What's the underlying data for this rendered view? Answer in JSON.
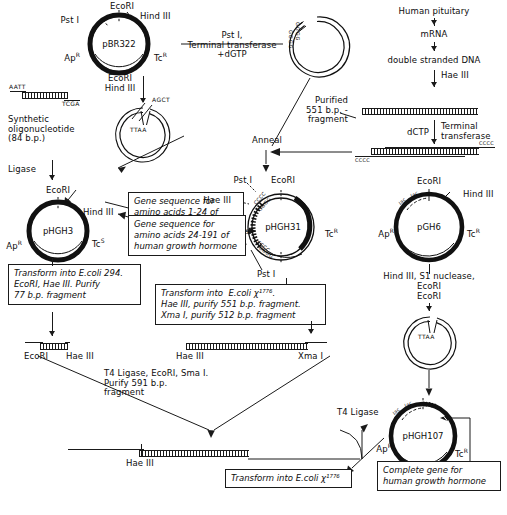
{
  "diagram": {
    "type": "molecular-cloning-flowchart"
  },
  "plasmids": {
    "pbr322": {
      "name": "pBR322",
      "markers": [
        "Pst I",
        "EcoRI",
        "Hind III",
        "Ap",
        "Tc"
      ],
      "pst": "Pst I",
      "ecori": "EcoRI",
      "hindiii": "Hind III",
      "ap": "Ap",
      "ap_sup": "R",
      "tc": "Tc",
      "tc_sup": "R"
    },
    "tailed": {
      "name": "",
      "tail": "GGGG"
    },
    "linear_hind": {
      "tail": "AGCT",
      "inner": "TTAA"
    },
    "phgh3": {
      "name": "pHGH3",
      "ecori": "EcoRI",
      "hindiii": "Hind III",
      "ap": "Ap",
      "ap_sup": "R",
      "tc": "Tc",
      "tc_sup": "S"
    },
    "phgh31": {
      "name": "pHGH31",
      "pst": "Pst I",
      "ecori": "EcoRI",
      "haeiii_top": "Hae III",
      "haeiii_bottom": "Hae III",
      "pst_bottom": "Pst I",
      "ap": "Ap",
      "ap_sup": "S",
      "tc": "Tc",
      "tc_sup": "R",
      "tails": [
        "CCCC",
        "GGGG",
        "CCCC",
        "GGGG"
      ]
    },
    "pgh6": {
      "name": "pGH6",
      "ecori": "EcoRI",
      "hindiii": "Hind III",
      "promoter": "lac",
      "promoter2": "lac",
      "ap": "Ap",
      "ap_sup": "R",
      "tc": "Tc",
      "tc_sup": "R"
    },
    "pgh6_cut": {
      "inner": "TTAA"
    },
    "phgh107": {
      "name": "pHGH107",
      "promoter": "lac",
      "promoter2": "lac",
      "ap": "Ap",
      "ap_sup": "R",
      "tc": "Tc",
      "tc_sup": "R"
    }
  },
  "reactions": {
    "pst_terminal_transferase": "Pst I,\nTerminal transferase\n+dGTP",
    "ecori_hindiii": "EcoRI\nHind III",
    "ligase": "Ligase",
    "anneal": "Anneal",
    "haeiii": "Hae III",
    "dctp": "dCTP",
    "terminal_transferase": "Terminal\ntransferase",
    "hindiii_s1_ecori": "Hind III, S1 nuclease,\nEcoRI",
    "ecori_step": "EcoRI",
    "t4_ligase": "T4 Ligase"
  },
  "pathway_right": {
    "source": "Human pituitary",
    "mrna": "mRNA",
    "ds_dna": "double stranded DNA",
    "purified_fragment": "Purified\n551 b.p. -\nfragment"
  },
  "oligo": {
    "caption": "Synthetic\noligonucleotide\n(84 b.p.)",
    "left_seq": "AATT",
    "right_seq": "TCGA"
  },
  "annotations": {
    "gene_1_24": "Gene sequence for\namino acids 1-24 of\nhuman growth hormone",
    "gene_24_191": "Gene sequence for\namino acids 24-191 of\nhuman growth hormone",
    "complete_gene": "Complete gene for\nhuman growth hormone"
  },
  "protocol_boxes": {
    "transform_294": "Transform into E.coli 294.\nEcoRI, Hae III. Purify\n77 b.p. fragment",
    "transform_x1776": "Transform into  E.coli χ¹⁷⁷⁶.\nHae III, purify 551 b.p. fragment.\nXma I, purify 512 b.p. fragment",
    "t4_ligase_ecori_smai": "T4 Ligase, EcoRI, Sma I.\nPurify 591 b.p.\nfragment",
    "transform_final": "Transform into E.coli χ¹⁷⁷⁶"
  },
  "fragments": {
    "frag_77_left": "EcoRI",
    "frag_77_right": "Hae III",
    "frag_512_left": "Hae III",
    "frag_512_right": "Xma I",
    "frag_591_label": "Hae III",
    "tails_cccc_left": "CCCC",
    "tails_cccc_right": "CCCC"
  }
}
